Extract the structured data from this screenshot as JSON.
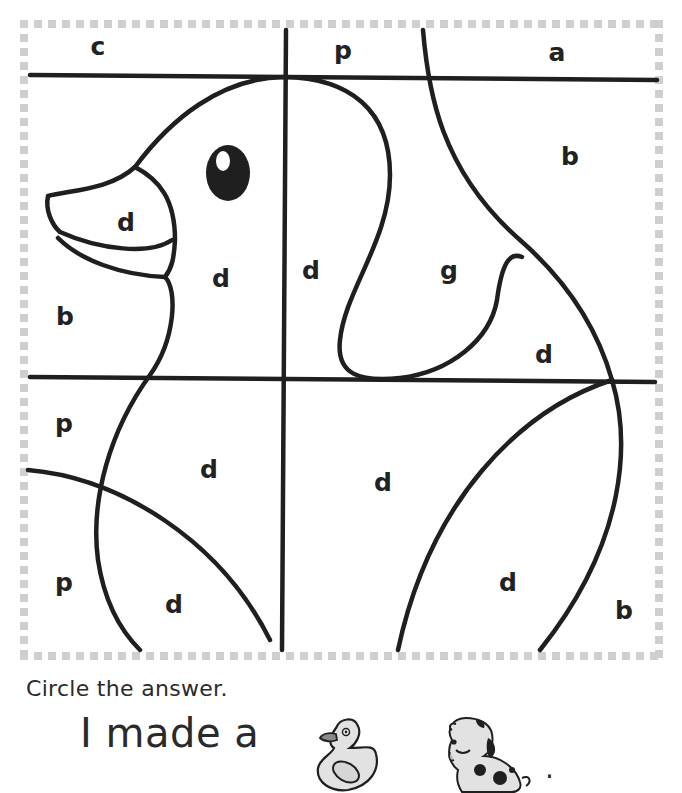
{
  "worksheet": {
    "grid_cells": [
      {
        "id": "top-left",
        "letter": "c",
        "x": 98,
        "y": 46
      },
      {
        "id": "top-mid",
        "letter": "p",
        "x": 343,
        "y": 50
      },
      {
        "id": "top-right",
        "letter": "a",
        "x": 557,
        "y": 52
      },
      {
        "id": "beak-upper",
        "letter": "d",
        "x": 126,
        "y": 222
      },
      {
        "id": "head",
        "letter": "d",
        "x": 221,
        "y": 278
      },
      {
        "id": "left-bg",
        "letter": "b",
        "x": 65,
        "y": 316
      },
      {
        "id": "head-right",
        "letter": "d",
        "x": 311,
        "y": 270
      },
      {
        "id": "neck",
        "letter": "g",
        "x": 449,
        "y": 270
      },
      {
        "id": "top-right-bg",
        "letter": "b",
        "x": 570,
        "y": 156
      },
      {
        "id": "wing-top",
        "letter": "d",
        "x": 544,
        "y": 354
      },
      {
        "id": "lower-left-1",
        "letter": "p",
        "x": 64,
        "y": 423
      },
      {
        "id": "body-1",
        "letter": "d",
        "x": 209,
        "y": 469
      },
      {
        "id": "lower-left-2",
        "letter": "p",
        "x": 64,
        "y": 582
      },
      {
        "id": "body-2",
        "letter": "d",
        "x": 174,
        "y": 604
      },
      {
        "id": "body-3",
        "letter": "d",
        "x": 383,
        "y": 482
      },
      {
        "id": "wing",
        "letter": "d",
        "x": 508,
        "y": 582
      },
      {
        "id": "lower-right-bg",
        "letter": "b",
        "x": 624,
        "y": 610
      }
    ]
  },
  "instruction": "Circle the answer.",
  "sentence": "I made a",
  "answer_choices": [
    {
      "id": "duck",
      "icon": "duck-icon",
      "label": "duck"
    },
    {
      "id": "dog",
      "icon": "dog-icon",
      "label": "dog"
    }
  ],
  "period": ".",
  "colors": {
    "line": "#1f1f1f",
    "border_dash": "#c8c8c8",
    "icon_fill": "#e2e2e2"
  }
}
